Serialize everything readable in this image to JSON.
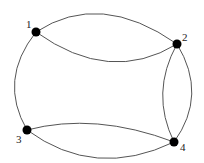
{
  "diagram": {
    "type": "multigraph",
    "nodes": [
      {
        "id": "1",
        "label": "1",
        "x": 36,
        "y": 32,
        "label_x": 26,
        "label_y": 28
      },
      {
        "id": "2",
        "label": "2",
        "x": 177,
        "y": 44,
        "label_x": 182,
        "label_y": 41
      },
      {
        "id": "3",
        "label": "3",
        "x": 27,
        "y": 130,
        "label_x": 16,
        "label_y": 143
      },
      {
        "id": "4",
        "label": "4",
        "x": 174,
        "y": 142,
        "label_x": 180,
        "label_y": 151
      }
    ],
    "edges": [
      {
        "from": "1",
        "to": "2",
        "curve": "upper"
      },
      {
        "from": "1",
        "to": "2",
        "curve": "lower"
      },
      {
        "from": "1",
        "to": "3",
        "curve": "left"
      },
      {
        "from": "2",
        "to": "4",
        "curve": "left"
      },
      {
        "from": "2",
        "to": "4",
        "curve": "right"
      },
      {
        "from": "3",
        "to": "4",
        "curve": "upper"
      },
      {
        "from": "3",
        "to": "4",
        "curve": "lower"
      }
    ],
    "colors": {
      "node": "#000000",
      "edge": "#555555",
      "background": "#ffffff"
    }
  }
}
